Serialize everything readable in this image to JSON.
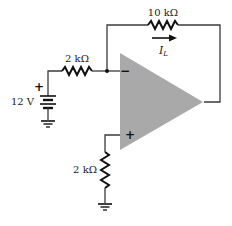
{
  "diagram": {
    "type": "op-amp circuit (inverting amplifier)",
    "colors": {
      "opamp_fill": "#a9a9a9",
      "wire": "#3a3a3a",
      "resistor": "#111111",
      "text": "#1a1a1a"
    },
    "source": {
      "label": "12 V",
      "polarity": "+"
    },
    "input_resistor": {
      "label": "2 kΩ"
    },
    "feedback_resistor": {
      "label": "10 kΩ"
    },
    "current": {
      "symbol": "I",
      "subscript": "L"
    },
    "ground_resistor": {
      "label": "2 kΩ"
    },
    "opamp": {
      "inverting_sign": "−",
      "noninverting_sign": "+"
    }
  }
}
